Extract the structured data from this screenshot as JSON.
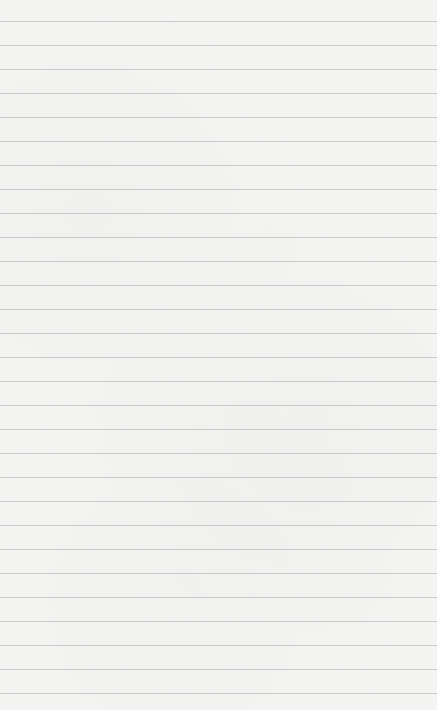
{
  "paper": {
    "description": "Lined paper texture",
    "background_color": "#f4f4f3",
    "line_color": "#c9c9c9",
    "first_line_y": 21,
    "line_spacing": 24,
    "line_count": 29
  }
}
